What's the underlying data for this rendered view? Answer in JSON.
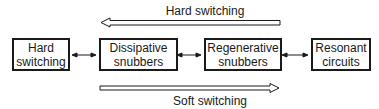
{
  "diagram": {
    "boxes": [
      {
        "line1": "Hard",
        "line2": "switching"
      },
      {
        "line1": "Dissipative",
        "line2": "snubbers"
      },
      {
        "line1": "Regenerative",
        "line2": "snubbers"
      },
      {
        "line1": "Resonant",
        "line2": "circuits"
      }
    ],
    "top_arrow": {
      "label": "Hard switching",
      "direction": "left"
    },
    "bottom_arrow": {
      "label": "Soft switching",
      "direction": "right"
    },
    "colors": {
      "stroke": "#1a1a1a",
      "background": "#ffffff"
    }
  }
}
